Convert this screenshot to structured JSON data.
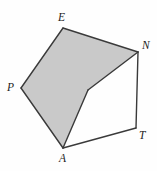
{
  "figure": {
    "kind": "geometry-polygon-diagram",
    "canvas": {
      "width": 157,
      "height": 171
    },
    "colors": {
      "background": "#fefefe",
      "shaded_fill": "#c9c9c9",
      "unshaded_fill": "#fefefe",
      "stroke": "#3a3a3a",
      "label_text": "#1c1c1c"
    },
    "stroke_width": 1.4,
    "vertices": [
      {
        "id": "P",
        "label": "P",
        "x": 21,
        "y": 88,
        "label_x": 7,
        "label_y": 82
      },
      {
        "id": "E",
        "label": "E",
        "x": 63,
        "y": 28,
        "label_x": 58,
        "label_y": 12
      },
      {
        "id": "N",
        "label": "N",
        "x": 138,
        "y": 52,
        "label_x": 142,
        "label_y": 40
      },
      {
        "id": "T",
        "label": "T",
        "x": 136,
        "y": 128,
        "label_x": 139,
        "label_y": 130
      },
      {
        "id": "A",
        "label": "A",
        "x": 63,
        "y": 148,
        "label_x": 59,
        "label_y": 153
      },
      {
        "id": "X",
        "label": "",
        "x": 88,
        "y": 90,
        "label_x": 0,
        "label_y": 0
      }
    ],
    "outer_polygon": {
      "name": "pentagon-PENTA",
      "points": "21,88 63,28 138,52 136,128 63,148"
    },
    "shaded_polygon": {
      "name": "shaded-region-PENXA",
      "points": "21,88 63,28 138,52 88,90 63,148"
    },
    "edges": [
      {
        "from": "P",
        "to": "E",
        "x1": 21,
        "y1": 88,
        "x2": 63,
        "y2": 28
      },
      {
        "from": "E",
        "to": "N",
        "x1": 63,
        "y1": 28,
        "x2": 138,
        "y2": 52
      },
      {
        "from": "N",
        "to": "T",
        "x1": 138,
        "y1": 52,
        "x2": 136,
        "y2": 128
      },
      {
        "from": "T",
        "to": "A",
        "x1": 136,
        "y1": 128,
        "x2": 63,
        "y2": 148
      },
      {
        "from": "A",
        "to": "P",
        "x1": 63,
        "y1": 148,
        "x2": 21,
        "y2": 88
      },
      {
        "from": "N",
        "to": "X",
        "x1": 138,
        "y1": 52,
        "x2": 88,
        "y2": 90
      },
      {
        "from": "X",
        "to": "A",
        "x1": 88,
        "y1": 90,
        "x2": 63,
        "y2": 148
      }
    ]
  }
}
